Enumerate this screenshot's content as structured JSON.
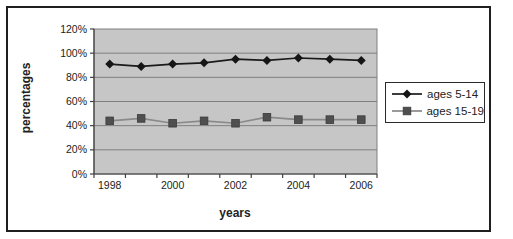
{
  "figure": {
    "background_color": "#ffffff",
    "frame_border_color": "#1f1f1f"
  },
  "chart_data": {
    "type": "line",
    "title": "",
    "xlabel": "years",
    "ylabel": "percentages",
    "x": [
      1998,
      1999,
      2000,
      2001,
      2002,
      2003,
      2004,
      2005,
      2006
    ],
    "x_axis_labels": [
      "1998",
      "2000",
      "2002",
      "2004",
      "2006"
    ],
    "x_label_indices": [
      0,
      2,
      4,
      6,
      8
    ],
    "y_tick_labels": [
      "0%",
      "20%",
      "40%",
      "60%",
      "80%",
      "100%",
      "120%"
    ],
    "ylim": [
      0,
      120
    ],
    "y_step": 20,
    "grid": true,
    "legend_position": "right",
    "plot_bg": "#c6c6c6",
    "gridline_color": "#7f7f7f",
    "axis_color": "#404040",
    "tick_label_color": "#222222",
    "series": [
      {
        "name": "ages 5-14",
        "marker": "diamond",
        "line_color": "#1a1a1a",
        "marker_fill": "#151515",
        "values": [
          91,
          89,
          91,
          92,
          95,
          94,
          96,
          95,
          94
        ]
      },
      {
        "name": "ages 15-19",
        "marker": "square",
        "line_color": "#8a8a8a",
        "marker_fill": "#4f4f4f",
        "values": [
          44,
          46,
          42,
          44,
          42,
          47,
          45,
          45,
          45
        ]
      }
    ]
  }
}
